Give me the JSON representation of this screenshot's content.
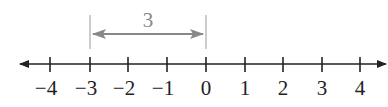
{
  "diagram": {
    "type": "number-line",
    "min": -4,
    "max": 4,
    "ticks": [
      -4,
      -3,
      -2,
      -1,
      0,
      1,
      2,
      3,
      4
    ],
    "tick_labels": [
      "−4",
      "−3",
      "−2",
      "−1",
      "0",
      "1",
      "2",
      "3",
      "4"
    ],
    "distance_annotation": {
      "from": -3,
      "to": 0,
      "label": "3"
    },
    "colors": {
      "axis": "#222222",
      "annotation": "#888888"
    }
  }
}
